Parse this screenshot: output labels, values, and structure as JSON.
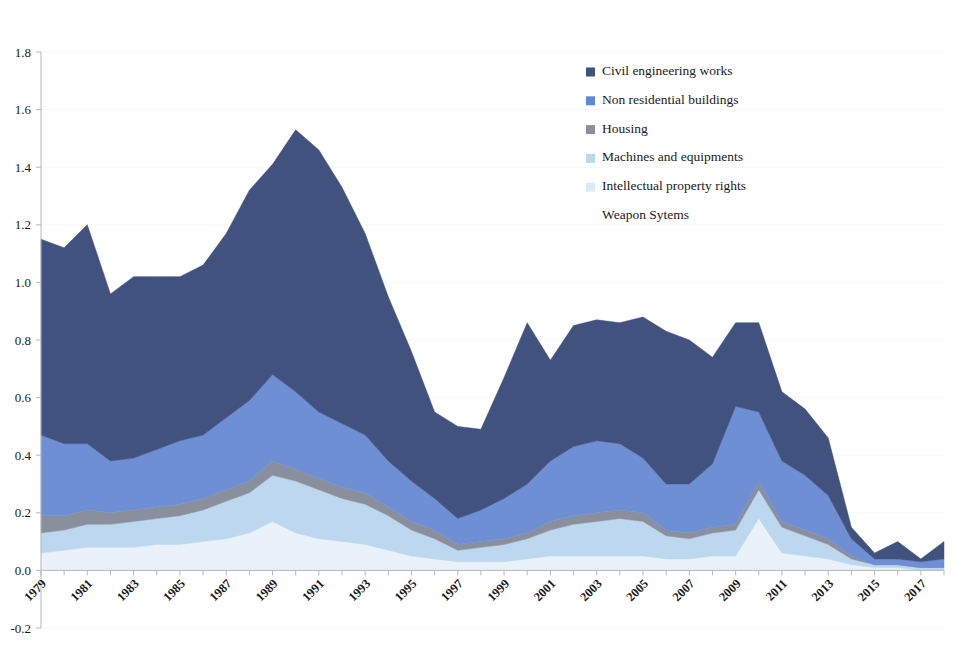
{
  "chart_data": {
    "type": "area",
    "stacked": true,
    "title": "",
    "subtitle": "",
    "xlabel": "",
    "ylabel": "",
    "ylim": [
      -0.2,
      1.8
    ],
    "yticks": [
      "-0.2",
      "0.0",
      "0.2",
      "0.4",
      "0.6",
      "0.8",
      "1.0",
      "1.2",
      "1.4",
      "1.6",
      "1.8"
    ],
    "ytick_values": [
      -0.2,
      0.0,
      0.2,
      0.4,
      0.6,
      0.8,
      1.0,
      1.2,
      1.4,
      1.6,
      1.8
    ],
    "grid": false,
    "legend_position": "top-right",
    "x": [
      1979,
      1980,
      1981,
      1982,
      1983,
      1984,
      1985,
      1986,
      1987,
      1988,
      1989,
      1990,
      1991,
      1992,
      1993,
      1994,
      1995,
      1996,
      1997,
      1998,
      1999,
      2000,
      2001,
      2002,
      2003,
      2004,
      2005,
      2006,
      2007,
      2008,
      2009,
      2010,
      2011,
      2012,
      2013,
      2014,
      2015,
      2016,
      2017,
      2018
    ],
    "xtick_labels": [
      "1979",
      "1981",
      "1983",
      "1985",
      "1987",
      "1989",
      "1991",
      "1993",
      "1995",
      "1997",
      "1999",
      "2001",
      "2003",
      "2005",
      "2007",
      "2009",
      "2011",
      "2013",
      "2015",
      "2017"
    ],
    "series": [
      {
        "name": "Intellectual property rights",
        "color": "#e9f2fa",
        "values": [
          0.06,
          0.07,
          0.08,
          0.08,
          0.08,
          0.09,
          0.09,
          0.1,
          0.11,
          0.13,
          0.17,
          0.13,
          0.11,
          0.1,
          0.09,
          0.07,
          0.05,
          0.04,
          0.03,
          0.03,
          0.03,
          0.04,
          0.05,
          0.05,
          0.05,
          0.05,
          0.05,
          0.04,
          0.04,
          0.05,
          0.05,
          0.18,
          0.06,
          0.05,
          0.04,
          0.02,
          0.01,
          0.01,
          0.0,
          0.0
        ]
      },
      {
        "name": "Machines and equipments",
        "color": "#bdd7ee",
        "values": [
          0.07,
          0.07,
          0.08,
          0.08,
          0.09,
          0.09,
          0.1,
          0.11,
          0.13,
          0.14,
          0.16,
          0.18,
          0.17,
          0.15,
          0.14,
          0.12,
          0.09,
          0.07,
          0.04,
          0.05,
          0.06,
          0.07,
          0.09,
          0.11,
          0.12,
          0.13,
          0.12,
          0.08,
          0.07,
          0.08,
          0.09,
          0.1,
          0.09,
          0.07,
          0.05,
          0.02,
          0.01,
          0.01,
          0.01,
          0.01
        ]
      },
      {
        "name": "Housing",
        "color": "#8a8f9e",
        "values": [
          0.06,
          0.05,
          0.05,
          0.04,
          0.04,
          0.04,
          0.04,
          0.04,
          0.04,
          0.04,
          0.05,
          0.04,
          0.04,
          0.04,
          0.04,
          0.03,
          0.03,
          0.03,
          0.02,
          0.02,
          0.02,
          0.02,
          0.03,
          0.03,
          0.03,
          0.03,
          0.03,
          0.02,
          0.02,
          0.02,
          0.02,
          0.03,
          0.02,
          0.02,
          0.02,
          0.01,
          0.0,
          0.0,
          0.0,
          0.0
        ]
      },
      {
        "name": "Non residential buildings",
        "color": "#6e8fd4",
        "values": [
          0.28,
          0.25,
          0.23,
          0.18,
          0.18,
          0.2,
          0.22,
          0.22,
          0.25,
          0.28,
          0.3,
          0.27,
          0.23,
          0.22,
          0.2,
          0.16,
          0.14,
          0.11,
          0.09,
          0.11,
          0.14,
          0.17,
          0.21,
          0.24,
          0.25,
          0.23,
          0.19,
          0.16,
          0.17,
          0.22,
          0.41,
          0.24,
          0.21,
          0.19,
          0.15,
          0.06,
          0.02,
          0.02,
          0.02,
          0.03
        ]
      },
      {
        "name": "Civil engineering works",
        "color": "#41527e",
        "values": [
          0.68,
          0.68,
          0.76,
          0.58,
          0.63,
          0.6,
          0.57,
          0.59,
          0.64,
          0.73,
          0.73,
          0.91,
          0.91,
          0.82,
          0.7,
          0.57,
          0.45,
          0.3,
          0.32,
          0.28,
          0.42,
          0.56,
          0.35,
          0.42,
          0.42,
          0.42,
          0.49,
          0.53,
          0.5,
          0.37,
          0.29,
          0.31,
          0.24,
          0.23,
          0.2,
          0.04,
          0.02,
          0.06,
          0.01,
          0.06
        ]
      },
      {
        "name": "Weapon Sytems",
        "color": "#ffffff",
        "values": [
          0.0,
          0.0,
          0.0,
          0.0,
          0.0,
          0.0,
          0.0,
          0.0,
          0.0,
          0.0,
          0.0,
          0.0,
          0.0,
          0.0,
          0.0,
          0.0,
          0.0,
          0.0,
          0.0,
          0.0,
          0.0,
          0.0,
          0.0,
          0.0,
          0.0,
          0.0,
          0.0,
          0.0,
          0.0,
          0.0,
          0.0,
          0.0,
          0.0,
          0.0,
          0.0,
          0.0,
          0.0,
          0.0,
          0.0,
          0.0
        ]
      }
    ],
    "totals": [
      1.15,
      1.12,
      1.2,
      0.96,
      1.02,
      1.02,
      1.02,
      1.06,
      1.17,
      1.32,
      1.41,
      1.53,
      1.46,
      1.33,
      1.17,
      0.95,
      0.76,
      0.55,
      0.5,
      0.49,
      0.67,
      0.86,
      0.73,
      0.85,
      0.87,
      0.86,
      0.88,
      0.83,
      0.8,
      0.74,
      0.86,
      0.86,
      0.62,
      0.56,
      0.46,
      0.15,
      0.06,
      0.1,
      0.04,
      0.1
    ]
  },
  "legend": {
    "items": [
      {
        "label": "Civil engineering works",
        "color": "#41527e"
      },
      {
        "label": "Non residential buildings",
        "color": "#5b8ad6"
      },
      {
        "label": "Housing",
        "color": "#8a8f9e"
      },
      {
        "label": "Machines and equipments",
        "color": "#bdd7ee"
      },
      {
        "label": "Intellectual property rights",
        "color": "#dceaf7"
      },
      {
        "label": "Weapon Sytems",
        "color": "#ffffff"
      }
    ]
  }
}
